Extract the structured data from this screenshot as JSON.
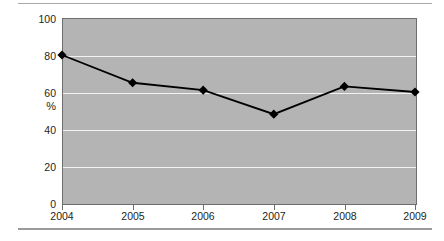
{
  "chart_data": {
    "type": "line",
    "title": "",
    "subtitle": "",
    "xlabel": "",
    "ylabel": "%",
    "categories": [
      "2004",
      "2005",
      "2006",
      "2007",
      "2008",
      "2009"
    ],
    "values": [
      80,
      65,
      61,
      48,
      63,
      60
    ],
    "series": [
      {
        "name": "",
        "values": [
          80,
          65,
          61,
          48,
          63,
          60
        ]
      }
    ],
    "ylim": [
      0,
      100
    ],
    "yticks": [
      0,
      20,
      40,
      60,
      80,
      100
    ],
    "ytick_labels": [
      "0",
      "20",
      "40",
      "60",
      "80",
      "100"
    ],
    "xtick_labels": [
      "2004",
      "2005",
      "2006",
      "2007",
      "2008",
      "2009"
    ],
    "grid": true,
    "grid_axis": "y",
    "legend": false,
    "legend_position": "none",
    "marker": "diamond",
    "colors": {
      "plot_background": "#b4b4b4",
      "gridline": "#f2f2f2",
      "line": "#000000",
      "marker": "#000000",
      "axis": "#6e6e6e",
      "text": "#231f20",
      "page_background": "#ffffff",
      "rule": "#a8a8a8"
    }
  },
  "axes": {
    "y_title": "%",
    "y_labels": [
      "100",
      "80",
      "60",
      "40",
      "20",
      "0"
    ],
    "x_labels": [
      "2004",
      "2005",
      "2006",
      "2007",
      "2008",
      "2009"
    ]
  }
}
